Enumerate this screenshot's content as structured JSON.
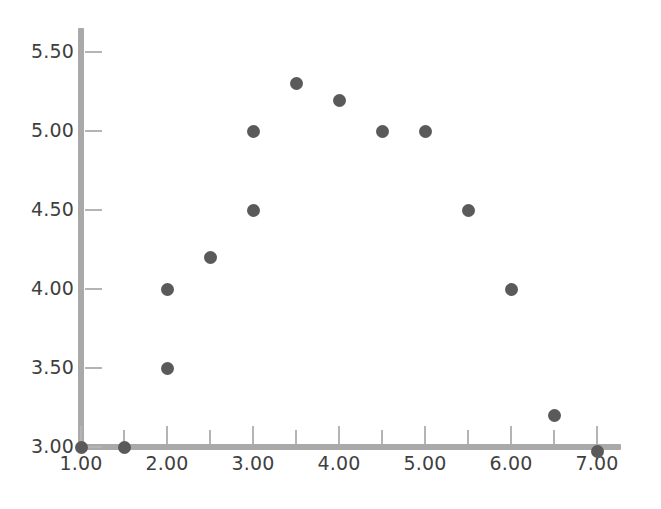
{
  "chart_data": {
    "type": "scatter",
    "title": "",
    "xlabel": "",
    "ylabel": "",
    "xlim": [
      1.0,
      7.35
    ],
    "ylim": [
      2.95,
      5.66
    ],
    "grid": false,
    "legend": null,
    "marker_color": "#5a5a5a",
    "axis_color": "#a9a9a9",
    "tick_color": "#b4b4b4",
    "label_color": "#3f3f3f",
    "background": "#ffffff",
    "xticks": [
      1.0,
      2.0,
      3.0,
      4.0,
      5.0,
      6.0,
      7.0
    ],
    "xticklabels": [
      "1.00",
      "2.00",
      "3.00",
      "4.00",
      "5.00",
      "6.00",
      "7.00"
    ],
    "yticks": [
      3.0,
      3.5,
      4.0,
      4.5,
      5.0,
      5.5
    ],
    "yticklabels": [
      "3.00",
      "3.50",
      "4.00",
      "4.50",
      "5.00",
      "5.50"
    ],
    "minor_xticks": [
      1.5,
      2.5,
      3.5,
      4.5,
      5.5,
      6.5
    ],
    "x": [
      1.0,
      1.5,
      2.0,
      2.0,
      2.5,
      3.0,
      3.0,
      3.5,
      4.0,
      4.5,
      5.0,
      5.5,
      6.0,
      6.5,
      7.0
    ],
    "y": [
      3.0,
      3.0,
      3.5,
      4.0,
      4.2,
      4.5,
      5.0,
      5.3,
      5.19,
      5.0,
      5.0,
      4.5,
      4.0,
      3.2,
      2.97
    ],
    "points": [
      {
        "x": 1.0,
        "y": 3.0
      },
      {
        "x": 1.5,
        "y": 3.0
      },
      {
        "x": 2.0,
        "y": 3.5
      },
      {
        "x": 2.0,
        "y": 4.0
      },
      {
        "x": 2.5,
        "y": 4.2
      },
      {
        "x": 3.0,
        "y": 4.5
      },
      {
        "x": 3.0,
        "y": 5.0
      },
      {
        "x": 3.5,
        "y": 5.3
      },
      {
        "x": 4.0,
        "y": 5.19
      },
      {
        "x": 4.5,
        "y": 5.0
      },
      {
        "x": 5.0,
        "y": 5.0
      },
      {
        "x": 5.5,
        "y": 4.5
      },
      {
        "x": 6.0,
        "y": 4.0
      },
      {
        "x": 6.5,
        "y": 3.2
      },
      {
        "x": 7.0,
        "y": 2.97
      }
    ]
  },
  "axes_geometry": {
    "x_origin_px": 81,
    "y_origin_px": 447,
    "px_per_x_unit": 86,
    "px_per_y_unit": 158
  }
}
